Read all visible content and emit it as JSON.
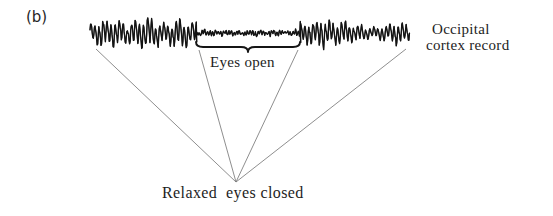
{
  "figure": {
    "panel_label": "(b)",
    "background_color": "#ffffff",
    "ink_color": "#1a1a1a",
    "leader_color": "#6b6b6b"
  },
  "labels": {
    "eyes_open": "Eyes open",
    "relaxed_eyes_closed": "Relaxed  eyes closed",
    "record_line1": "Occipital",
    "record_line2": "cortex record"
  },
  "chart_data": {
    "type": "line",
    "subtitle": "(b)",
    "xlabel": "",
    "ylabel": "",
    "grid": false,
    "legend": null,
    "axes_visible": false,
    "x": {
      "units": "trace position (px along record)",
      "range": [
        90,
        410
      ]
    },
    "y": {
      "units": "relative amplitude (arbitrary)",
      "baseline": 33,
      "range": [
        -1,
        1
      ]
    },
    "segments": [
      {
        "name": "Relaxed eyes closed (left)",
        "state": "eyes closed",
        "rhythm": "alpha",
        "x_start": 90,
        "x_end": 196,
        "relative_amplitude": 1.0,
        "dominant_frequency_band": "alpha (8-13 Hz)"
      },
      {
        "name": "Eyes open",
        "state": "eyes open",
        "rhythm": "beta / desynchronized",
        "x_start": 196,
        "x_end": 300,
        "relative_amplitude": 0.2,
        "dominant_frequency_band": "beta (13-30 Hz)"
      },
      {
        "name": "Relaxed eyes closed (right)",
        "state": "eyes closed",
        "rhythm": "alpha",
        "x_start": 300,
        "x_end": 410,
        "relative_amplitude": 0.85,
        "dominant_frequency_band": "alpha (8-13 Hz)"
      }
    ],
    "annotations": [
      {
        "text": "Eyes open",
        "type": "brace",
        "brace_x_start": 196,
        "brace_x_end": 300,
        "brace_y": 47,
        "label_x": 210,
        "label_y": 54
      },
      {
        "text": "Relaxed  eyes closed",
        "type": "leader-lines",
        "apex_x": 236,
        "apex_y": 182,
        "label_x": 162,
        "label_y": 184,
        "leader_origins": [
          {
            "x": 96,
            "y": 49
          },
          {
            "x": 199,
            "y": 50
          },
          {
            "x": 298,
            "y": 50
          },
          {
            "x": 406,
            "y": 49
          }
        ]
      },
      {
        "text": "Occipital cortex record",
        "type": "label",
        "label_x": 432,
        "label_y": 21
      }
    ]
  }
}
